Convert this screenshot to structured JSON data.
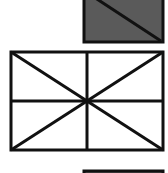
{
  "colors": {
    "background": "#ffffff",
    "stroke": "#111111",
    "shaded_fill": "#5a5a5a"
  },
  "shapes": [
    {
      "name": "shaded-square-with-diagonal",
      "fill": "#5a5a5a",
      "rect": {
        "x": 84,
        "y": -40,
        "w": 79,
        "h": 82
      },
      "lines": [
        [
          74,
          -16,
          161,
          41
        ]
      ]
    },
    {
      "name": "rectangle-with-star-lines",
      "fill": "#ffffff",
      "rect": {
        "x": 11,
        "y": 52,
        "w": 152,
        "h": 98
      },
      "lines": [
        [
          87,
          52,
          87,
          150
        ],
        [
          11,
          101,
          163,
          101
        ],
        [
          11,
          52,
          163,
          150
        ],
        [
          163,
          52,
          11,
          150
        ]
      ]
    },
    {
      "name": "partial-shape-bottom",
      "fill": "#5a5a5a",
      "rect": {
        "x": 84,
        "y": 171,
        "w": 79,
        "h": 40
      },
      "lines": []
    }
  ]
}
